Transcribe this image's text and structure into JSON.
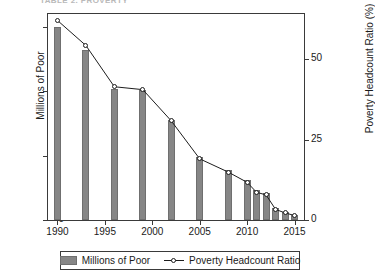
{
  "top_strip": {
    "text": "TABLE 2. PROVERTY"
  },
  "chart_data": {
    "type": "bar",
    "title": "",
    "xlabel": "",
    "ylabel": "Millions of Poor",
    "y2label": "Poverty Headcount Ratio (%)",
    "x": [
      1990,
      1993,
      1996,
      1999,
      2002,
      2005,
      2008,
      2010,
      2011,
      2012,
      2013,
      2014,
      2015
    ],
    "xlim": [
      1989,
      2016
    ],
    "ylim": [
      0,
      800
    ],
    "y2lim": [
      0,
      64
    ],
    "grid": false,
    "legend_position": "bottom",
    "xticks": [
      "1990",
      "1995",
      "2000",
      "2005",
      "2010",
      "2015"
    ],
    "xtick_values": [
      1990,
      1995,
      2000,
      2005,
      2010,
      2015
    ],
    "yticks": [
      "0",
      "250",
      "500",
      "750"
    ],
    "ytick_values": [
      0,
      250,
      500,
      750
    ],
    "y2ticks": [
      "0",
      "25",
      "50"
    ],
    "y2tick_values": [
      0,
      25,
      50
    ],
    "series": [
      {
        "name": "Millions of Poor",
        "type": "bar",
        "axis": "left",
        "color": "#868686",
        "values": [
          750,
          660,
          510,
          505,
          390,
          245,
          195,
          155,
          115,
          105,
          45,
          30,
          20
        ]
      },
      {
        "name": "Poverty Headcount Ratio",
        "type": "line",
        "axis": "right",
        "color": "#1d1d1d",
        "values": [
          62.0,
          54.2,
          41.4,
          40.5,
          30.8,
          19.0,
          14.9,
          11.7,
          8.6,
          7.8,
          3.3,
          2.2,
          1.4
        ]
      }
    ]
  },
  "legend": {
    "items": [
      {
        "label": "Millions of Poor",
        "marker": "bar-swatch"
      },
      {
        "label": "Poverty Headcount Ratio",
        "marker": "line-circle"
      }
    ]
  }
}
